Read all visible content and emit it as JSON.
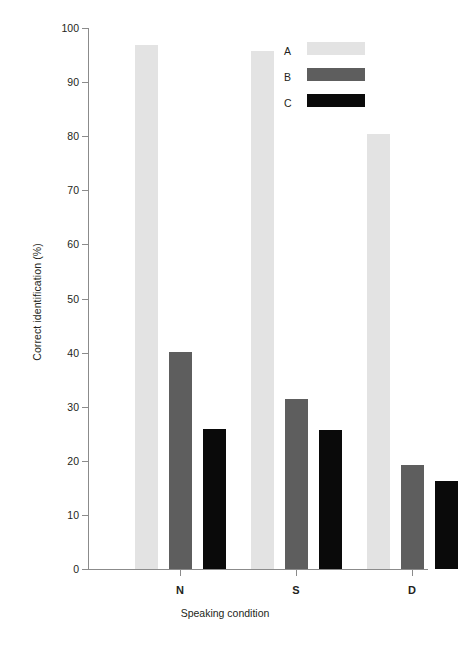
{
  "chart_data": {
    "type": "bar",
    "title": "",
    "xlabel": "Speaking condition",
    "ylabel": "Correct identification (%)",
    "categories": [
      "N",
      "S",
      "D"
    ],
    "series": [
      {
        "name": "A",
        "color": "#e3e3e3",
        "values": [
          96.8,
          95.8,
          80.4
        ]
      },
      {
        "name": "B",
        "color": "#5e5e5e",
        "values": [
          40.1,
          31.5,
          19.3
        ]
      },
      {
        "name": "C",
        "color": "#0a0a0a",
        "values": [
          25.8,
          25.7,
          16.3
        ]
      }
    ],
    "ylim": [
      0,
      100
    ],
    "ytick_labels": [
      "100",
      "90",
      "80",
      "70",
      "60",
      "50",
      "40",
      "30",
      "20",
      "10",
      "0"
    ],
    "ytick_values": [
      100,
      90,
      80,
      70,
      60,
      50,
      40,
      30,
      20,
      10,
      0
    ],
    "grid": false,
    "legend_position": "top-right",
    "legend_entries": [
      "A",
      "B",
      "C"
    ],
    "axis_color": "#8b8b8b",
    "text_color": "#231f20"
  }
}
